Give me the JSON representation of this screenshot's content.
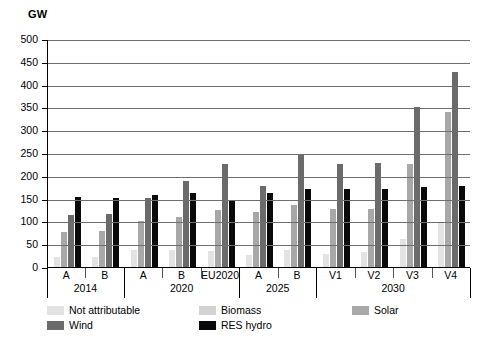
{
  "chart_data": {
    "type": "bar",
    "title": "",
    "ylabel": "GW",
    "xlabel": "",
    "ylim": [
      0,
      500
    ],
    "yticks": [
      0,
      50,
      100,
      150,
      200,
      250,
      300,
      350,
      400,
      450,
      500
    ],
    "grid": true,
    "legend_position": "bottom",
    "categories": [
      "A",
      "B",
      "A",
      "B",
      "EU2020",
      "A",
      "B",
      "V1",
      "V2",
      "V3",
      "V4"
    ],
    "period_groups": [
      {
        "label": "2014",
        "span": 2
      },
      {
        "label": "2020",
        "span": 3
      },
      {
        "label": "2025",
        "span": 2
      },
      {
        "label": "2030",
        "span": 4
      }
    ],
    "series": [
      {
        "name": "Not attributable",
        "color": "#e3e3e3",
        "values": [
          23,
          23,
          38,
          38,
          35,
          27,
          38,
          28,
          33,
          62,
          97
        ]
      },
      {
        "name": "Biomass",
        "color": "#d2d2d2",
        "values": [
          0,
          0,
          0,
          0,
          0,
          0,
          0,
          0,
          0,
          0,
          0
        ]
      },
      {
        "name": "Solar",
        "color": "#a8a8a8",
        "values": [
          77,
          78,
          100,
          110,
          125,
          120,
          135,
          127,
          128,
          225,
          340
        ]
      },
      {
        "name": "Wind",
        "color": "#6b6b6b",
        "values": [
          113,
          117,
          152,
          188,
          225,
          177,
          248,
          225,
          228,
          350,
          427
        ]
      },
      {
        "name": "RES hydro",
        "color": "#0a0a0a",
        "values": [
          153,
          152,
          158,
          162,
          147,
          163,
          172,
          170,
          172,
          175,
          177
        ]
      }
    ],
    "legend_entries": [
      {
        "label": "Not attributable",
        "color": "#e3e3e3"
      },
      {
        "label": "Biomass",
        "color": "#d2d2d2"
      },
      {
        "label": "Solar",
        "color": "#a8a8a8"
      },
      {
        "label": "Wind",
        "color": "#6b6b6b"
      },
      {
        "label": "RES hydro",
        "color": "#0a0a0a"
      }
    ]
  }
}
